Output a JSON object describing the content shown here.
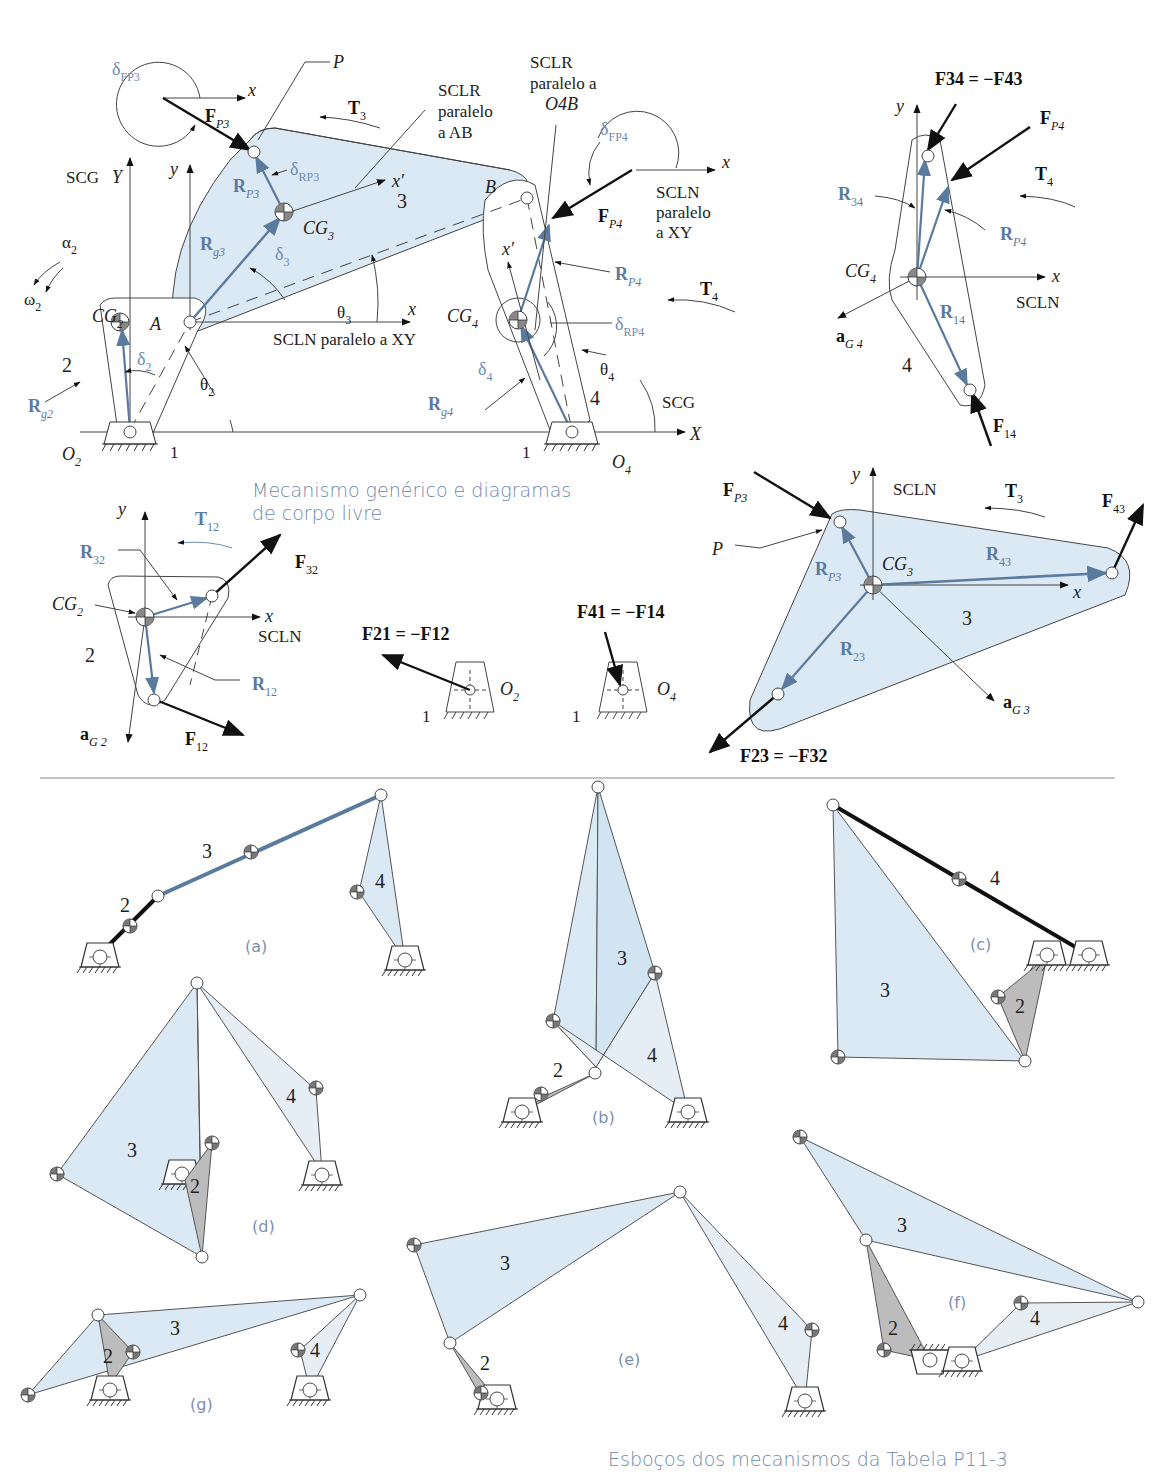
{
  "colors": {
    "link_fill_blue": "#dbe9f4",
    "link_fill_grey": "#bcbcbc",
    "vector_blue": "#5a7a9e",
    "caption_blue": "#7088aa",
    "line": "#333333"
  },
  "top_figure": {
    "caption_line1": "Mecanismo genérico e diagramas",
    "caption_line2": "de corpo livre",
    "main_mechanism": {
      "labels": {
        "delta_FP3": "δ",
        "delta_FP3_sub": "FP3",
        "x_top": "x",
        "FP3": "F",
        "FP3_sub": "P3",
        "P": "P",
        "T3": "T",
        "T3_sub": "3",
        "sclr_ab_1": "SCLR",
        "sclr_ab_2": "paralelo",
        "sclr_ab_3": "a AB",
        "sclr_o4b_1": "SCLR",
        "sclr_o4b_2": "paralelo a",
        "sclr_o4b_3": "O4B",
        "delta_FP4": "δ",
        "delta_FP4_sub": "FP4",
        "x_right": "x",
        "scln_xy_1": "SCLN",
        "scln_xy_2": "paralelo",
        "scln_xy_3": "a XY",
        "FP4": "F",
        "FP4_sub": "P4",
        "scg": "SCG",
        "Y": "Y",
        "y": "y",
        "RP3": "R",
        "RP3_sub": "P3",
        "delta_RP3": "δ",
        "delta_RP3_sub": "RP3",
        "x_prime_3": "x′",
        "three": "3",
        "CG3": "CG",
        "CG3_sub": "3",
        "B": "B",
        "alpha2": "α",
        "alpha2_sub": "2",
        "omega2": "ω",
        "omega2_sub": "2",
        "Rg3": "R",
        "Rg3_sub": "g3",
        "delta3": "δ",
        "delta3_sub": "3",
        "x_prime_4": "x′",
        "RP4": "R",
        "RP4_sub": "P4",
        "T4": "T",
        "T4_sub": "4",
        "CG2": "CG",
        "CG2_sub": "2",
        "A": "A",
        "theta3": "θ",
        "theta3_sub": "3",
        "x_mid": "x",
        "scln_mid": "SCLN paralelo a XY",
        "CG4": "CG",
        "CG4_sub": "4",
        "delta_RP4": "δ",
        "delta_RP4_sub": "RP4",
        "two": "2",
        "delta2": "δ",
        "delta2_sub": "2",
        "delta4": "δ",
        "delta4_sub": "4",
        "theta4": "θ",
        "theta4_sub": "4",
        "Rg2": "R",
        "Rg2_sub": "g2",
        "theta2": "θ",
        "theta2_sub": "2",
        "Rg4": "R",
        "Rg4_sub": "g4",
        "four": "4",
        "scg_right": "SCG",
        "X": "X",
        "O2": "O",
        "O2_sub": "2",
        "one_left": "1",
        "one_right": "1",
        "O4": "O",
        "O4_sub": "4"
      }
    },
    "fbd_link4": {
      "F34_eq": "F34 = −F43",
      "y": "y",
      "FP4": "F",
      "FP4_sub": "P4",
      "T4": "T",
      "T4_sub": "4",
      "R34": "R",
      "R34_sub": "34",
      "RP4": "R",
      "RP4_sub": "P4",
      "CG4": "CG",
      "CG4_sub": "4",
      "x": "x",
      "scln": "SCLN",
      "R14": "R",
      "R14_sub": "14",
      "aG4": "a",
      "aG4_sub": "G 4",
      "four": "4",
      "F14": "F",
      "F14_sub": "14"
    },
    "fbd_link2": {
      "y": "y",
      "T12": "T",
      "T12_sub": "12",
      "R32": "R",
      "R32_sub": "32",
      "F32": "F",
      "F32_sub": "32",
      "CG2": "CG",
      "CG2_sub": "2",
      "x": "x",
      "scln": "SCLN",
      "two": "2",
      "R12": "R",
      "R12_sub": "12",
      "aG2": "a",
      "aG2_sub": "G 2",
      "F12": "F",
      "F12_sub": "12"
    },
    "fbd_ground": {
      "F21_eq": "F21 = −F12",
      "O2": "O",
      "O2_sub": "2",
      "one_a": "1",
      "F41_eq": "F41 = −F14",
      "O4": "O",
      "O4_sub": "4",
      "one_b": "1"
    },
    "fbd_link3": {
      "FP3": "F",
      "FP3_sub": "P3",
      "y": "y",
      "scln": "SCLN",
      "T3": "T",
      "T3_sub": "3",
      "F43": "F",
      "F43_sub": "43",
      "P": "P",
      "RP3": "R",
      "RP3_sub": "P3",
      "CG3": "CG",
      "CG3_sub": "3",
      "R43": "R",
      "R43_sub": "43",
      "x": "x",
      "three": "3",
      "R23": "R",
      "R23_sub": "23",
      "aG3": "a",
      "aG3_sub": "G 3",
      "F23_eq": "F23 = −F32"
    }
  },
  "bottom_figure": {
    "caption": "Esboços dos mecanismos da Tabela P11-3",
    "sketches": [
      {
        "id": "a",
        "tag": "(a)",
        "links": [
          "2",
          "3",
          "4"
        ]
      },
      {
        "id": "b",
        "tag": "(b)",
        "links": [
          "2",
          "3",
          "4"
        ]
      },
      {
        "id": "c",
        "tag": "(c)",
        "links": [
          "2",
          "3",
          "4"
        ]
      },
      {
        "id": "d",
        "tag": "(d)",
        "links": [
          "2",
          "3",
          "4"
        ]
      },
      {
        "id": "e",
        "tag": "(e)",
        "links": [
          "2",
          "3",
          "4"
        ]
      },
      {
        "id": "f",
        "tag": "(f)",
        "links": [
          "2",
          "3",
          "4"
        ]
      },
      {
        "id": "g",
        "tag": "(g)",
        "links": [
          "2",
          "3",
          "4"
        ]
      }
    ]
  }
}
